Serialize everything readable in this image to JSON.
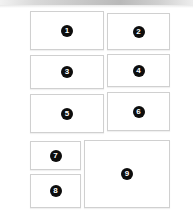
{
  "page": {
    "background_color": "#ffffff",
    "width": 193,
    "height": 216
  },
  "top_band": {
    "name": "top-gradient-band",
    "colors": [
      "#f2f2f2",
      "#d9d9d9",
      "#c9c9c9",
      "#b9b9b9",
      "#cfcfcf",
      "#ededed"
    ]
  },
  "style": {
    "panel_fill": "#ffffff",
    "panel_border": "#d0d0d0",
    "badge_fill": "#0d0d0d",
    "badge_text": "#ffffff"
  },
  "panels": [
    {
      "label": "1",
      "name": "panel-1",
      "x": 30,
      "y": 11,
      "w": 74,
      "h": 39
    },
    {
      "label": "2",
      "name": "panel-2",
      "x": 107,
      "y": 13,
      "w": 63,
      "h": 37
    },
    {
      "label": "3",
      "name": "panel-3",
      "x": 30,
      "y": 55,
      "w": 74,
      "h": 34
    },
    {
      "label": "4",
      "name": "panel-4",
      "x": 107,
      "y": 54,
      "w": 63,
      "h": 33
    },
    {
      "label": "5",
      "name": "panel-5",
      "x": 30,
      "y": 94,
      "w": 74,
      "h": 39
    },
    {
      "label": "6",
      "name": "panel-6",
      "x": 107,
      "y": 92,
      "w": 63,
      "h": 39
    },
    {
      "label": "7",
      "name": "panel-7",
      "x": 30,
      "y": 141,
      "w": 51,
      "h": 29
    },
    {
      "label": "8",
      "name": "panel-8",
      "x": 30,
      "y": 174,
      "w": 51,
      "h": 34
    },
    {
      "label": "9",
      "name": "panel-9",
      "x": 84,
      "y": 140,
      "w": 86,
      "h": 68
    }
  ]
}
